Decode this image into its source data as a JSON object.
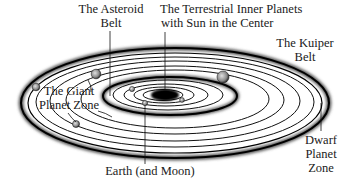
{
  "diagram": {
    "labels": {
      "asteroid_belt": {
        "line1": "The Asteroid",
        "line2": "Belt"
      },
      "terrestrial": {
        "line1": "The Terrestrial Inner Planets",
        "line2": "with Sun in the Center"
      },
      "kuiper_belt": {
        "line1": "The Kuiper",
        "line2": "Belt"
      },
      "giant_planet_zone": {
        "line1": "The Giant",
        "line2": "Planet Zone"
      },
      "earth": {
        "line1": "Earth (and Moon)"
      },
      "dwarf_planet_zone": {
        "line1": "Dwarf",
        "line2": "Planet",
        "line3": "Zone"
      }
    },
    "colors": {
      "orbit": "#111111",
      "background": "#ffffff",
      "planet": "#9a9a9a",
      "sun": "#000000"
    }
  }
}
